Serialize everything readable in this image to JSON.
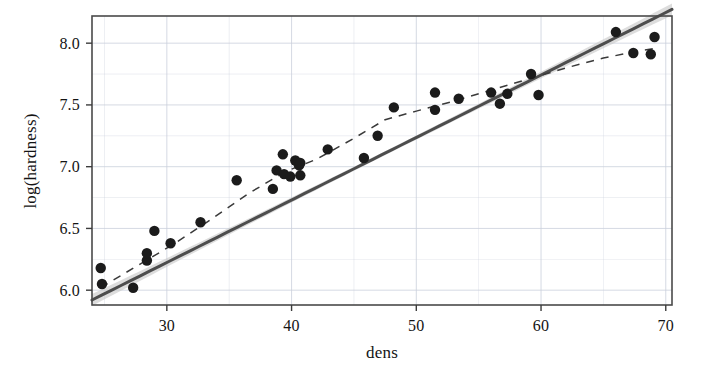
{
  "chart_data": {
    "type": "scatter",
    "title": "",
    "xlabel": "dens",
    "ylabel": "log(hardness)",
    "xlim": [
      24.0,
      70.5
    ],
    "ylim": [
      5.88,
      8.22
    ],
    "xticks": [
      30,
      40,
      50,
      60,
      70
    ],
    "yticks": [
      6.0,
      6.5,
      7.0,
      7.5,
      8.0
    ],
    "xtick_labels": [
      "30",
      "40",
      "50",
      "60",
      "70"
    ],
    "ytick_labels": [
      "6.0",
      "6.5",
      "7.0",
      "7.5",
      "8.0"
    ],
    "x_minor_ticks": [
      25,
      35,
      45,
      55,
      65
    ],
    "y_minor_ticks": [
      6.25,
      6.75,
      7.25,
      7.75
    ],
    "grid": true,
    "grid_color": "#c9cfdb",
    "legend": "none",
    "point_color": "#1b1b1b",
    "point_size": 5.2,
    "series": [
      {
        "name": "observations",
        "x": [
          24.7,
          24.8,
          27.3,
          28.4,
          28.4,
          29.0,
          30.3,
          32.7,
          35.6,
          38.5,
          38.8,
          39.3,
          39.4,
          39.9,
          40.3,
          40.6,
          40.7,
          40.7,
          42.9,
          45.8,
          46.9,
          48.2,
          51.5,
          51.5,
          53.4,
          56.0,
          56.7,
          57.3,
          59.2,
          59.8,
          66.0,
          67.4,
          68.8,
          69.1
        ],
        "y": [
          6.18,
          6.05,
          6.02,
          6.24,
          6.3,
          6.48,
          6.38,
          6.55,
          6.89,
          6.82,
          6.97,
          7.1,
          6.94,
          6.92,
          7.05,
          7.01,
          6.93,
          7.03,
          7.14,
          7.07,
          7.25,
          7.48,
          7.46,
          7.6,
          7.55,
          7.6,
          7.51,
          7.59,
          7.75,
          7.58,
          8.09,
          7.92,
          7.91,
          8.05
        ]
      }
    ],
    "fits": [
      {
        "name": "linear-fit",
        "style": "solid",
        "color": "#4d4d4d",
        "intercept": 4.706,
        "slope": 0.0506,
        "band": {
          "name": "confidence-band",
          "color": "#c8c8c8",
          "opacity": 0.62,
          "half_width_center": 0.016,
          "half_width_edge": 0.048
        }
      },
      {
        "name": "smoother-fit",
        "style": "dashed",
        "color": "#3a3a3a",
        "points_x": [
          24.7,
          27.5,
          30.5,
          33.5,
          36.5,
          39.5,
          42.0,
          45.0,
          47.5,
          50.0,
          53.0,
          56.0,
          59.0,
          62.0,
          65.0,
          68.0,
          69.3
        ],
        "points_y": [
          6.02,
          6.19,
          6.37,
          6.57,
          6.78,
          6.96,
          7.06,
          7.23,
          7.38,
          7.45,
          7.53,
          7.62,
          7.71,
          7.8,
          7.88,
          7.94,
          7.96
        ]
      }
    ]
  },
  "plot_frame": {
    "left": 92,
    "top": 16,
    "right": 672,
    "bottom": 305,
    "border_color": "#4a4a4a",
    "background": "#ffffff"
  }
}
